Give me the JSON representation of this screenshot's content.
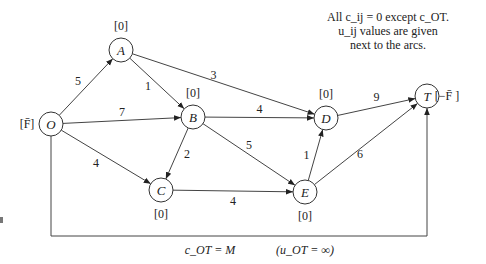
{
  "note": {
    "line1": "All c_ij = 0 except c_OT.",
    "line2": "u_ij values are given",
    "line3": "next to the arcs."
  },
  "nodes": [
    {
      "id": "O",
      "label": "O",
      "annotation": "[F̄]"
    },
    {
      "id": "A",
      "label": "A",
      "annotation": "[0]"
    },
    {
      "id": "B",
      "label": "B",
      "annotation": "[0]"
    },
    {
      "id": "C",
      "label": "C",
      "annotation": "[0]"
    },
    {
      "id": "D",
      "label": "D",
      "annotation": "[0]"
    },
    {
      "id": "E",
      "label": "E",
      "annotation": "[0]"
    },
    {
      "id": "T",
      "label": "T",
      "annotation": "[−F̄ ]"
    }
  ],
  "edges": [
    {
      "from": "O",
      "to": "A",
      "capacity": "5"
    },
    {
      "from": "O",
      "to": "B",
      "capacity": "7"
    },
    {
      "from": "O",
      "to": "C",
      "capacity": "4"
    },
    {
      "from": "A",
      "to": "B",
      "capacity": "1"
    },
    {
      "from": "A",
      "to": "D",
      "capacity": "3"
    },
    {
      "from": "B",
      "to": "C",
      "capacity": "2"
    },
    {
      "from": "B",
      "to": "D",
      "capacity": "4"
    },
    {
      "from": "B",
      "to": "E",
      "capacity": "5"
    },
    {
      "from": "C",
      "to": "E",
      "capacity": "4"
    },
    {
      "from": "E",
      "to": "D",
      "capacity": "1"
    },
    {
      "from": "D",
      "to": "T",
      "capacity": "9"
    },
    {
      "from": "E",
      "to": "T",
      "capacity": "6"
    },
    {
      "from": "O",
      "to": "T",
      "capacity": "∞",
      "cost": "M"
    }
  ],
  "bottom_arc": {
    "cost_label": "c_OT = M",
    "capacity_label": "(u_OT = ∞)"
  }
}
